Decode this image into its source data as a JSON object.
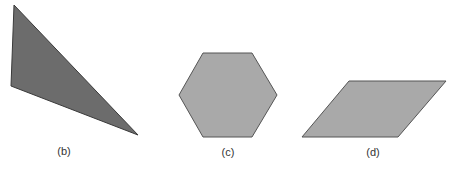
{
  "figures": [
    {
      "id": "b",
      "label": "(b)",
      "shape": "triangle",
      "points": "14,5 11,86 138,135",
      "fill": "#6c6c6c",
      "stroke": "#3a3a3a",
      "label_x": 64,
      "label_y": 145
    },
    {
      "id": "c",
      "label": "(c)",
      "shape": "hexagon",
      "points": "203,53 252,53 277,95 252,137 203,137 179,95",
      "fill": "#a9a9a9",
      "stroke": "#555555",
      "label_x": 228,
      "label_y": 146
    },
    {
      "id": "d",
      "label": "(d)",
      "shape": "parallelogram",
      "points": "349,81 446,81 398,137 302,137",
      "fill": "#a9a9a9",
      "stroke": "#555555",
      "label_x": 373,
      "label_y": 146
    }
  ]
}
